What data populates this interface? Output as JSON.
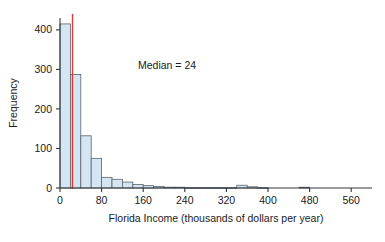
{
  "chart_data": {
    "type": "bar",
    "title": "",
    "subtitle": "",
    "xlabel": "Florida Income (thousands of dollars per year)",
    "ylabel": "Frequency",
    "xlim": [
      0,
      600
    ],
    "ylim": [
      0,
      430
    ],
    "grid": false,
    "legend": null,
    "bin_width": 20,
    "xticks": [
      0,
      80,
      160,
      240,
      320,
      400,
      480,
      560
    ],
    "xtick_labels": [
      "0",
      "80",
      "160",
      "240",
      "320",
      "400",
      "480",
      "560"
    ],
    "yticks": [
      0,
      100,
      200,
      300,
      400
    ],
    "ytick_labels": [
      "0",
      "100",
      "200",
      "300",
      "400"
    ],
    "bin_starts": [
      0,
      20,
      40,
      60,
      80,
      100,
      120,
      140,
      160,
      180,
      200,
      220,
      240,
      260,
      280,
      300,
      320,
      340,
      360,
      380,
      400,
      420,
      440,
      460,
      480,
      500,
      520,
      540,
      560,
      580
    ],
    "values": [
      415,
      287,
      132,
      75,
      27,
      22,
      15,
      9,
      6,
      4,
      2,
      2,
      1,
      1,
      1,
      1,
      1,
      7,
      3,
      1,
      0,
      0,
      0,
      2,
      0,
      0,
      0,
      0,
      0,
      0
    ],
    "annotations": [
      {
        "name": "median-label",
        "text": "Median = 24",
        "x": 150,
        "y": 300
      },
      {
        "name": "median-marker",
        "type": "vline",
        "value": 24,
        "color": "#e8342a"
      }
    ],
    "colors": {
      "bar_fill": "#d4e6f4",
      "bar_stroke": "#5a6369",
      "median_line": "#e8342a",
      "axis": "#33373a",
      "background": "#ffffff"
    }
  }
}
